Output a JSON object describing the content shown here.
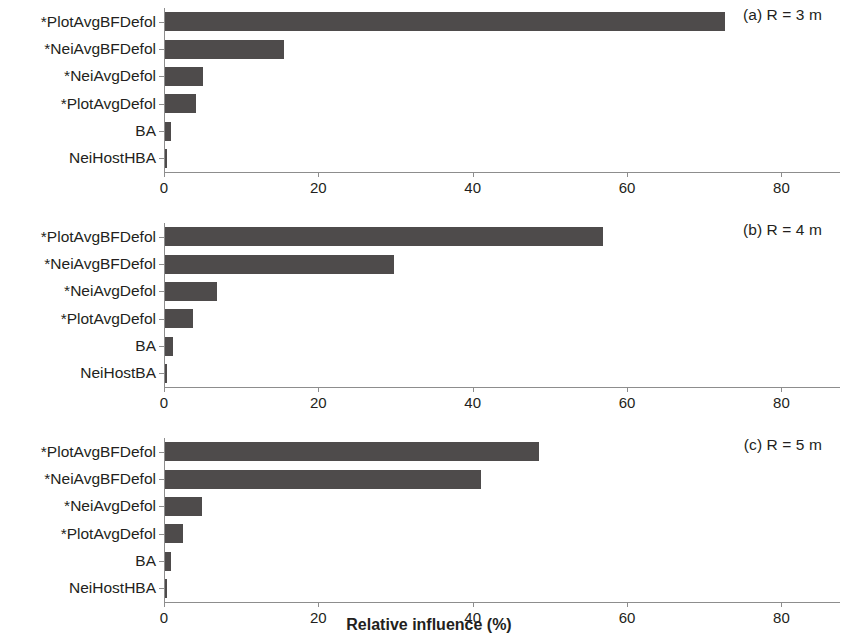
{
  "chart_data": {
    "type": "bar",
    "title": "",
    "xlabel": "Relative influence (%)",
    "ylabel": "",
    "orientation": "horizontal",
    "xlim": [
      0,
      85
    ],
    "xticks": [
      0,
      20,
      40,
      60,
      80
    ],
    "xtick_labels": [
      "0",
      "20",
      "40",
      "60",
      "80"
    ],
    "grid": false,
    "legend": "none",
    "bar_color": "#4e4b4b",
    "axis_color": "#8d8d8d",
    "panels": [
      {
        "id": "a",
        "label": "(a) R = 3 m",
        "categories": [
          "*PlotAvgBFDefol",
          "*NeiAvgBFDefol",
          "*NeiAvgDefol",
          "*PlotAvgDefol",
          "BA",
          "NeiHostHBA"
        ],
        "values": [
          72.5,
          15.4,
          4.9,
          4.0,
          0.8,
          0.1
        ]
      },
      {
        "id": "b",
        "label": "(b) R = 4 m",
        "categories": [
          "*PlotAvgBFDefol",
          "*NeiAvgBFDefol",
          "*NeiAvgDefol",
          "*PlotAvgDefol",
          "BA",
          "NeiHostBA"
        ],
        "values": [
          56.8,
          29.7,
          6.7,
          3.6,
          1.0,
          0.1
        ]
      },
      {
        "id": "c",
        "label": "(c) R = 5 m",
        "categories": [
          "*PlotAvgBFDefol",
          "*NeiAvgBFDefol",
          "*NeiAvgDefol",
          "*PlotAvgDefol",
          "BA",
          "NeiHostHBA"
        ],
        "values": [
          48.4,
          41.0,
          4.8,
          2.3,
          0.8,
          0.1
        ]
      }
    ]
  }
}
